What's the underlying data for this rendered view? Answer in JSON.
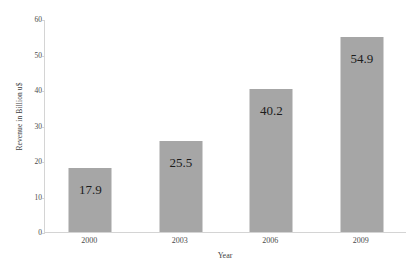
{
  "chart_data": {
    "type": "bar",
    "title": "",
    "subtitle": "",
    "categories": [
      "2000",
      "2003",
      "2006",
      "2009"
    ],
    "values": [
      17.9,
      25.5,
      40.2,
      54.9
    ],
    "data_labels": [
      "17.9",
      "25.5",
      "40.2",
      "54.9"
    ],
    "xlabel": "Year",
    "ylabel": "Revenue in Billion u$",
    "ylim": [
      0,
      60
    ],
    "ytick_labels": [
      "0",
      "10",
      "20",
      "30",
      "40",
      "50",
      "60"
    ],
    "ytick_values": [
      0,
      10,
      20,
      30,
      40,
      50,
      60
    ],
    "grid": false,
    "legend": null,
    "legend_position": "none",
    "bar_color": "#a6a6a6",
    "axis_color": "#d4d4d4",
    "label_text_color": "#1c1c1c",
    "background_color": "#ffffff"
  }
}
